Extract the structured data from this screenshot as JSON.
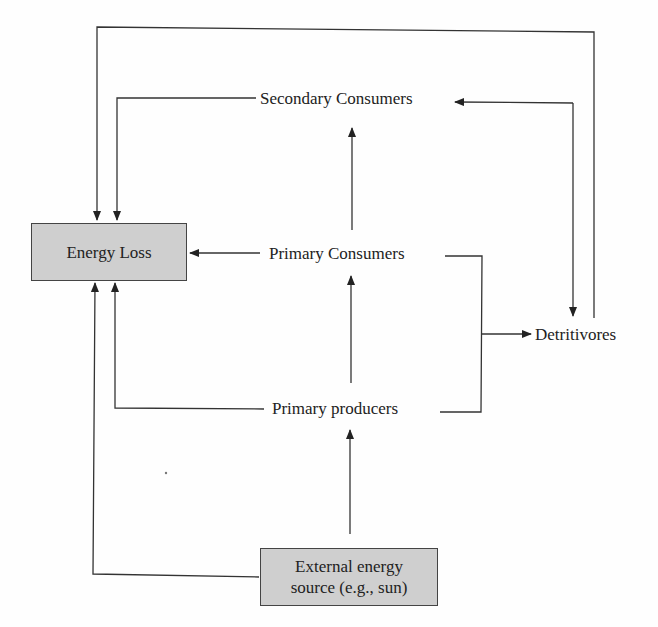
{
  "diagram": {
    "nodes": {
      "energy_loss": "Energy Loss",
      "secondary_consumers": "Secondary Consumers",
      "primary_consumers": "Primary Consumers",
      "primary_producers": "Primary producers",
      "detritivores": "Detritivores",
      "external_line1": "External energy",
      "external_line2": "source (e.g., sun)"
    },
    "edges": [
      {
        "from": "External energy source",
        "to": "Primary producers"
      },
      {
        "from": "External energy source",
        "to": "Energy Loss"
      },
      {
        "from": "Primary producers",
        "to": "Primary Consumers"
      },
      {
        "from": "Primary producers",
        "to": "Energy Loss"
      },
      {
        "from": "Primary producers",
        "to": "Detritivores"
      },
      {
        "from": "Primary Consumers",
        "to": "Secondary Consumers"
      },
      {
        "from": "Primary Consumers",
        "to": "Energy Loss"
      },
      {
        "from": "Primary Consumers",
        "to": "Detritivores"
      },
      {
        "from": "Secondary Consumers",
        "to": "Energy Loss"
      },
      {
        "from": "Secondary Consumers",
        "to": "Detritivores"
      },
      {
        "from": "Detritivores",
        "to": "Secondary Consumers"
      },
      {
        "from": "Detritivores",
        "to": "Energy Loss"
      }
    ],
    "colors": {
      "box_fill": "#cfcfcf",
      "line": "#333333"
    }
  }
}
